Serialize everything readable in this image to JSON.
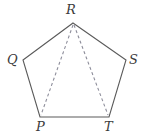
{
  "figure": {
    "name": "pentagon-with-diagonals",
    "shape_type": "regular pentagon",
    "background_color": "#ffffff",
    "solid_stroke_color": "#5a5a5a",
    "dashed_stroke_color": "#8d8d9a",
    "label_color": "#3b3b3b",
    "vertices": [
      {
        "id": "R",
        "label": "R",
        "x": 73,
        "y": 23,
        "label_x": 66,
        "label_y": 3
      },
      {
        "id": "S",
        "label": "S",
        "x": 126,
        "y": 60,
        "label_x": 129,
        "label_y": 53
      },
      {
        "id": "T",
        "label": "T",
        "x": 109,
        "y": 117,
        "label_x": 104,
        "label_y": 120
      },
      {
        "id": "P",
        "label": "P",
        "x": 40,
        "y": 117,
        "label_x": 36,
        "label_y": 120
      },
      {
        "id": "Q",
        "label": "Q",
        "x": 23,
        "y": 60,
        "label_x": 7,
        "label_y": 53
      }
    ],
    "outline_points": "73,23 126,60 109,117 40,117 23,60",
    "diagonals": [
      {
        "name": "diagonal-R-P",
        "from": "R",
        "to": "P",
        "x1": 73,
        "y1": 25,
        "x2": 41,
        "y2": 115,
        "style": "dashed"
      },
      {
        "name": "diagonal-R-T",
        "from": "R",
        "to": "T",
        "x1": 74,
        "y1": 25,
        "x2": 108,
        "y2": 115,
        "style": "dashed"
      }
    ]
  }
}
